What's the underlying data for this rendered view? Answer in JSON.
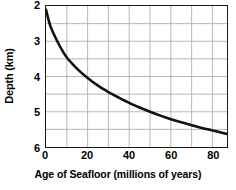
{
  "chart_data": {
    "type": "line",
    "title": "",
    "xlabel": "Age of Seafloor (millions of years)",
    "ylabel": "Depth (km)",
    "xlim": [
      0,
      87
    ],
    "ylim": [
      2,
      6
    ],
    "y_inverted": true,
    "grid": true,
    "legend": null,
    "x_ticks": [
      0,
      20,
      40,
      60,
      80
    ],
    "y_ticks": [
      2,
      3,
      4,
      5,
      6
    ],
    "x_gridlines": [
      10,
      20,
      30,
      40,
      50,
      60,
      70,
      80
    ],
    "y_gridlines": [
      2.5,
      3.0,
      3.5,
      4.0,
      4.5,
      5.0,
      5.5
    ],
    "series": [
      {
        "name": "Seafloor depth vs age",
        "color": "#111111",
        "x": [
          0,
          2,
          5,
          8,
          10,
          13,
          16,
          20,
          25,
          30,
          35,
          40,
          45,
          50,
          55,
          60,
          65,
          70,
          75,
          80,
          85,
          87
        ],
        "y": [
          2.1,
          2.55,
          2.95,
          3.28,
          3.46,
          3.66,
          3.84,
          4.04,
          4.26,
          4.44,
          4.6,
          4.75,
          4.88,
          5.0,
          5.11,
          5.21,
          5.3,
          5.38,
          5.46,
          5.53,
          5.6,
          5.63
        ]
      }
    ]
  },
  "axes": {
    "y_title": "Depth (km)",
    "x_title": "Age of Seafloor (millions of years)",
    "y_tick_labels": [
      "2",
      "3",
      "4",
      "5",
      "6"
    ],
    "x_tick_labels": [
      "0",
      "20",
      "40",
      "60",
      "80"
    ]
  },
  "colors": {
    "curve": "#111111",
    "frame": "#1a1a1a",
    "grid": "#b0b0b0",
    "background": "#ffffff",
    "text": "#000000"
  }
}
